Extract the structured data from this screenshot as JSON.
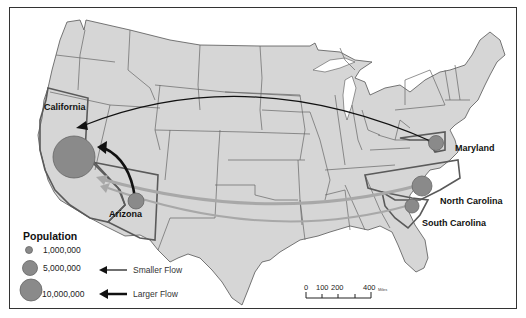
{
  "map": {
    "title": "",
    "colors": {
      "land": "#d6d6d6",
      "state_border": "#555555",
      "highlight_border": "#5a5a5a",
      "population_circle": "#8a8a8a",
      "large_flow": "#111111",
      "small_flow": "#a8a8a8",
      "background": "#ffffff"
    },
    "states": [
      {
        "name": "California",
        "population_symbol": "~10,000,000+"
      },
      {
        "name": "Arizona",
        "population_symbol": "~1,000,000-5,000,000"
      },
      {
        "name": "Maryland",
        "population_symbol": "~1,000,000-5,000,000"
      },
      {
        "name": "North Carolina",
        "population_symbol": "~5,000,000"
      },
      {
        "name": "South Carolina",
        "population_symbol": "~1,000,000-5,000,000"
      }
    ],
    "labels": {
      "california": "California",
      "arizona": "Arizona",
      "maryland": "Maryland",
      "north_carolina": "North Carolina",
      "south_carolina": "South Carolina"
    },
    "flows": [
      {
        "from": "Maryland",
        "to": "California",
        "type": "Larger Flow"
      },
      {
        "from": "Arizona",
        "to": "California",
        "type": "Larger Flow"
      },
      {
        "from": "North Carolina",
        "to": "California",
        "type": "Smaller Flow"
      },
      {
        "from": "South Carolina",
        "to": "California",
        "type": "Smaller Flow"
      }
    ]
  },
  "legend": {
    "title": "Population",
    "sizes": [
      {
        "label": "1,000,000"
      },
      {
        "label": "5,000,000"
      },
      {
        "label": "10,000,000"
      }
    ],
    "flows": [
      {
        "label": "Smaller Flow"
      },
      {
        "label": "Larger Flow"
      }
    ]
  },
  "scale_bar": {
    "ticks": [
      "0",
      "100",
      "200",
      "400"
    ],
    "unit": "Miles"
  }
}
